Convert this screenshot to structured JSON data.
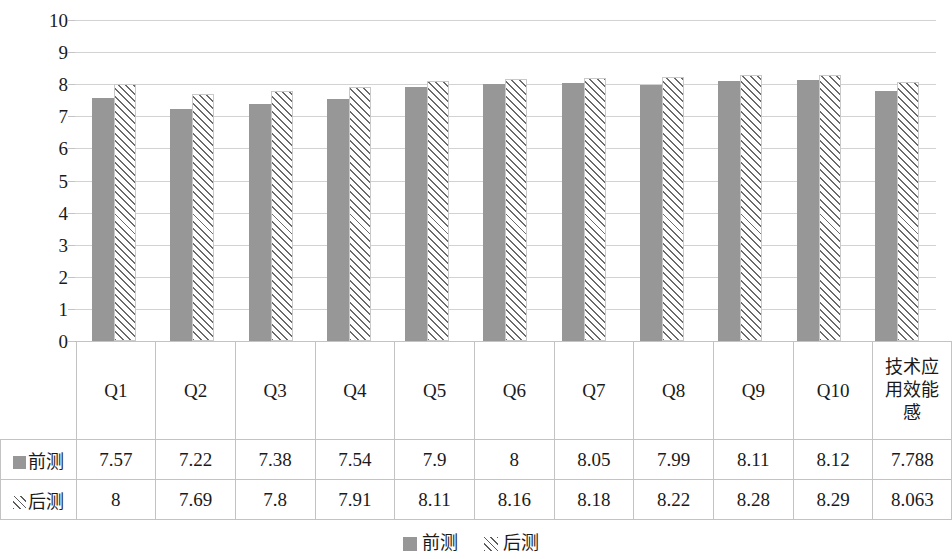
{
  "chart_data": {
    "type": "bar",
    "title": "",
    "subtitle": "",
    "xlabel": "",
    "ylabel": "",
    "ylim": [
      0,
      10
    ],
    "y_ticks": [
      0,
      1,
      2,
      3,
      4,
      5,
      6,
      7,
      8,
      9,
      10
    ],
    "y_tick_labels": [
      "0",
      "1",
      "2",
      "3",
      "4",
      "5",
      "6",
      "7",
      "8",
      "9",
      "10"
    ],
    "grid": true,
    "legend_position": "bottom",
    "categories": [
      "Q1",
      "Q2",
      "Q3",
      "Q4",
      "Q5",
      "Q6",
      "Q7",
      "Q8",
      "Q9",
      "Q10",
      "技术应用效能感"
    ],
    "series": [
      {
        "name": "前测",
        "style": "solid-gray",
        "color": "#979797",
        "values": [
          7.57,
          7.22,
          7.38,
          7.54,
          7.9,
          8,
          8.05,
          7.99,
          8.11,
          8.12,
          7.788
        ],
        "value_labels": [
          "7.57",
          "7.22",
          "7.38",
          "7.54",
          "7.9",
          "8",
          "8.05",
          "7.99",
          "8.11",
          "8.12",
          "7.788"
        ]
      },
      {
        "name": "后测",
        "style": "diagonal-hatch",
        "color": "#ffffff",
        "hatch_color": "#6b6b6b",
        "values": [
          8,
          7.69,
          7.8,
          7.91,
          8.11,
          8.16,
          8.18,
          8.22,
          8.28,
          8.29,
          8.063
        ],
        "value_labels": [
          "8",
          "7.69",
          "7.8",
          "7.91",
          "8.11",
          "8.16",
          "8.18",
          "8.22",
          "8.28",
          "8.29",
          "8.063"
        ]
      }
    ]
  },
  "data_table": {
    "header_blank_label": "",
    "column_headers": [
      "Q1",
      "Q2",
      "Q3",
      "Q4",
      "Q5",
      "Q6",
      "Q7",
      "Q8",
      "Q9",
      "Q10",
      "技术应用效能感"
    ],
    "rows": [
      {
        "marker": "solid-square-marker",
        "label": "前测",
        "cells": [
          "7.57",
          "7.22",
          "7.38",
          "7.54",
          "7.9",
          "8",
          "8.05",
          "7.99",
          "8.11",
          "8.12",
          "7.788"
        ]
      },
      {
        "marker": "hatched-square-marker",
        "label": "后测",
        "cells": [
          "8",
          "7.69",
          "7.8",
          "7.91",
          "8.11",
          "8.16",
          "8.18",
          "8.22",
          "8.28",
          "8.29",
          "8.063"
        ]
      }
    ]
  },
  "legend": {
    "entries": [
      {
        "icon": "solid-square-swatch",
        "label": "前测"
      },
      {
        "icon": "hatched-square-swatch",
        "label": "后测"
      }
    ]
  },
  "colors": {
    "series_pre": "#979797",
    "series_post_fill": "#ffffff",
    "series_post_hatch": "#6b6b6b",
    "gridline": "#d2d2d2",
    "table_border": "#c3c3c3",
    "text": "#1a1a1a"
  }
}
